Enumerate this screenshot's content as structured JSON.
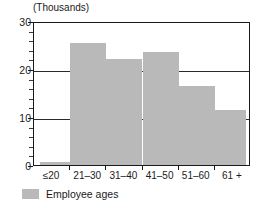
{
  "chart_data": {
    "type": "bar",
    "title": "",
    "axis_unit_note": "(Thousands)",
    "xlabel": "",
    "ylabel": "",
    "categories": [
      "≤20",
      "21–30",
      "31–40",
      "41–50",
      "51–60",
      "61 +"
    ],
    "values": [
      0.6,
      25.5,
      22,
      23.5,
      16.5,
      11.5
    ],
    "series": [
      {
        "name": "Employee ages",
        "color": "#b9b9b9",
        "values": [
          0.6,
          25.5,
          22,
          23.5,
          16.5,
          11.5
        ]
      }
    ],
    "ylim": [
      0,
      30
    ],
    "y_major_ticks": [
      "0",
      "10",
      "20",
      "30"
    ],
    "y_major_tick_values": [
      0,
      10,
      20,
      30
    ],
    "y_minor_tick_values": [
      2,
      4,
      6,
      8,
      12,
      14,
      16,
      18,
      22,
      24,
      26,
      28
    ],
    "grid": "horizontal-major",
    "gridline_values": [
      10,
      20
    ],
    "legend": {
      "position": "bottom-left",
      "entries": [
        {
          "label": "Employee ages",
          "color": "#b9b9b9"
        }
      ]
    }
  },
  "colors": {
    "bar_fill": "#b9b9b9",
    "axis": "#1a1a1a",
    "gridline": "#2b2b2b",
    "background": "#ffffff"
  },
  "legend": {
    "label": "Employee ages"
  },
  "axis": {
    "unit_note": "(Thousands)"
  }
}
